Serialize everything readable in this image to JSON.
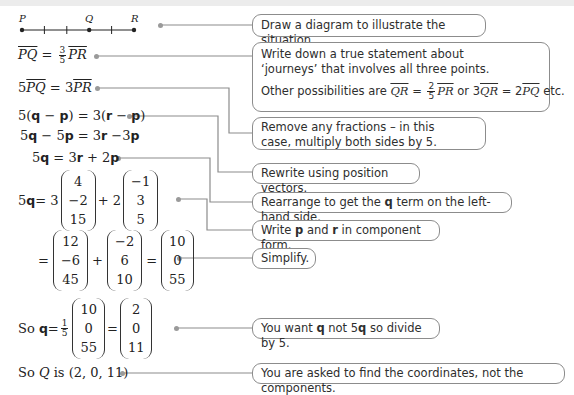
{
  "diagram": {
    "points": [
      {
        "label": "P"
      },
      {
        "label": "Q"
      },
      {
        "label": "R"
      }
    ],
    "segments_total": 5,
    "Q_position_segments": 3
  },
  "steps": {
    "s1": {
      "lhs_vec": "PQ",
      "eq": "=",
      "frac_num": "3",
      "frac_den": "5",
      "rhs_vec": "PR"
    },
    "s2": {
      "coef1": "5",
      "vec1": "PQ",
      "eq": "=",
      "coef2": "3",
      "vec2": "PR"
    },
    "s3": {
      "a": "5(",
      "q": "q",
      "minus1": " − ",
      "p1": "p",
      "mid": ") = 3(",
      "r": "r",
      "minus2": " − ",
      "p2": "p",
      "end": ")"
    },
    "s4": {
      "a": "5",
      "q": "q",
      "b": " − 5",
      "p": "p",
      "c": " = 3",
      "r": "r",
      "d": " −3",
      "p2": "p"
    },
    "s5": {
      "a": "5",
      "q": "q",
      "b": " = 3",
      "r": "r",
      "c": " + 2",
      "p": "p"
    },
    "s6": {
      "lhs_coef": "5",
      "lhs_q": "q",
      "eq": " = 3",
      "v1": [
        "4",
        "−2",
        "15"
      ],
      "plus": "+ 2",
      "v2": [
        "−1",
        "3",
        "5"
      ]
    },
    "s7": {
      "eq": "=",
      "v1": [
        "12",
        "−6",
        "45"
      ],
      "plus": "+",
      "v2": [
        "−2",
        "6",
        "10"
      ],
      "eq2": "=",
      "v3": [
        "10",
        "0",
        "55"
      ]
    },
    "s8": {
      "so": "So ",
      "q": "q",
      "eq": " = ",
      "frac_num": "1",
      "frac_den": "5",
      "v1": [
        "10",
        "0",
        "55"
      ],
      "eq2": "=",
      "v2": [
        "2",
        "0",
        "11"
      ]
    },
    "s9": {
      "so": "So ",
      "Q": "Q",
      "rest": " is (2, 0, 11)"
    }
  },
  "notes": {
    "n1": "Draw a diagram to illustrate the situation.",
    "n2_line1": "Write down a true statement about ‘journeys’ that involves all three points.",
    "n2_line2_prefix": "Other possibilities are ",
    "n2_alt1_lhs": "QR",
    "n2_alt1_frac_num": "2",
    "n2_alt1_frac_den": "5",
    "n2_alt1_rhs": "PR",
    "n2_or": " or 3",
    "n2_alt2_lhs": "QR",
    "n2_alt2_mid": " = 2",
    "n2_alt2_rhs": "PQ",
    "n2_etc": " etc.",
    "n3": "Remove any fractions – in this case, multiply both sides by 5.",
    "n4": "Rewrite using position vectors.",
    "n5_a": "Rearrange to get the ",
    "n5_q": "q",
    "n5_b": " term on the left-hand side.",
    "n6_a": "Write ",
    "n6_p": "p",
    "n6_b": " and ",
    "n6_r": "r",
    "n6_c": " in component form.",
    "n7": "Simplify.",
    "n8_a": "You want ",
    "n8_q": "q",
    "n8_b": " not 5",
    "n8_q2": "q",
    "n8_c": " so divide by 5.",
    "n9": "You are asked to find the coordinates, not the components."
  },
  "colors": {
    "connector": "#8c8c8c",
    "box_border": "#8c8c8c",
    "text": "#2a2a2a",
    "top_band": "#ececec"
  }
}
